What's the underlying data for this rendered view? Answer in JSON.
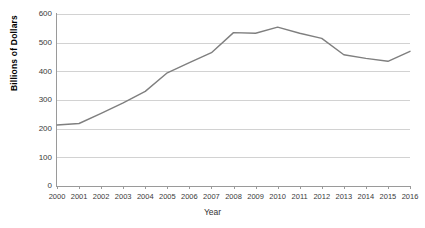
{
  "chart_data": {
    "type": "line",
    "title": "",
    "xlabel": "Year",
    "ylabel": "Billions of Dollars",
    "x": [
      2000,
      2001,
      2002,
      2003,
      2004,
      2005,
      2006,
      2007,
      2008,
      2009,
      2010,
      2011,
      2012,
      2013,
      2014,
      2015,
      2016
    ],
    "categories": [
      "2000",
      "2001",
      "2002",
      "2003",
      "2004",
      "2005",
      "2006",
      "2007",
      "2008",
      "2009",
      "2010",
      "2011",
      "2012",
      "2013",
      "2014",
      "2015",
      "2016"
    ],
    "values": [
      213,
      218,
      253,
      290,
      330,
      395,
      430,
      465,
      535,
      533,
      554,
      533,
      515,
      458,
      445,
      435,
      470
    ],
    "series": [
      {
        "name": "Billions of Dollars",
        "values": [
          213,
          218,
          253,
          290,
          330,
          395,
          430,
          465,
          535,
          533,
          554,
          533,
          515,
          458,
          445,
          435,
          470
        ],
        "color": "#7f7f7f"
      }
    ],
    "ylim": [
      0,
      600
    ],
    "ytick_labels": [
      "600",
      "500",
      "400",
      "300",
      "200",
      "100",
      "0"
    ],
    "yticks": [
      600,
      500,
      400,
      300,
      200,
      100,
      0
    ],
    "xlim": [
      2000,
      2016
    ],
    "grid": "horizontal",
    "grid_color": "#d2d2d2",
    "legend": "none",
    "background": "#ffffff"
  }
}
